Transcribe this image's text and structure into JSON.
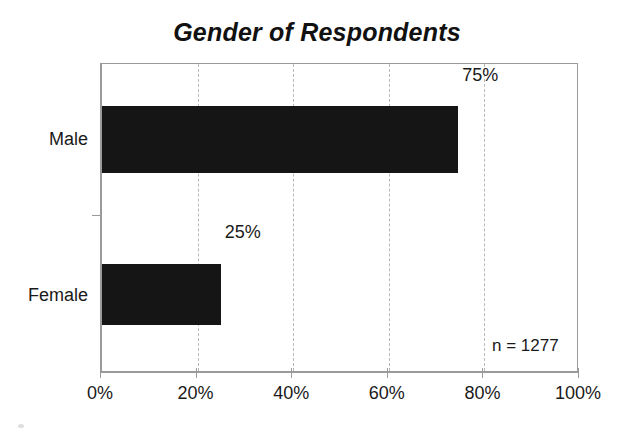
{
  "chart_data": {
    "type": "bar",
    "orientation": "horizontal",
    "title": "Gender of Respondents",
    "categories": [
      "Male",
      "Female"
    ],
    "values": [
      75,
      25
    ],
    "value_labels": [
      "75%",
      "25%"
    ],
    "xlabel": "",
    "ylabel": "",
    "xlim": [
      0,
      100
    ],
    "x_ticks": [
      0,
      20,
      40,
      60,
      80,
      100
    ],
    "x_tick_labels": [
      "0%",
      "20%",
      "40%",
      "60%",
      "80%",
      "100%"
    ],
    "grid": "vertical-dashed",
    "legend": "none",
    "annotation": "n = 1277",
    "bar_color": "#151515",
    "axis_color": "#9a9a9a",
    "gridline_color": "#b9b9b9",
    "text_color": "#1a1a1a",
    "background": "#ffffff"
  }
}
